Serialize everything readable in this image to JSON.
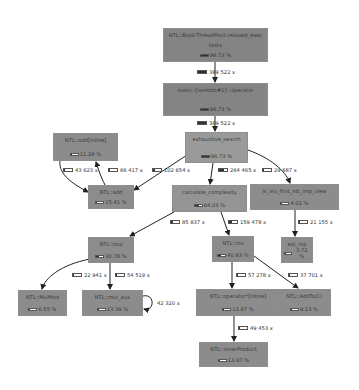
{
  "diagram": {
    "type": "call-graph",
    "nodes": [
      {
        "id": "n0",
        "name": "NTL::BasicThreadPool::relaxed_exec",
        "name2": "tasks",
        "pct": "96.73 %",
        "fill": 1.0,
        "color": "#848484",
        "x": 163,
        "y": 28,
        "w": 105,
        "h": 34
      },
      {
        "id": "n1",
        "name": "main::{lambda#1}::operator",
        "pct": "96.73 %",
        "fill": 1.0,
        "color": "#848484",
        "x": 163,
        "y": 83,
        "w": 105,
        "h": 33
      },
      {
        "id": "n2",
        "name": "exhaustive_search",
        "pct": "96.73 %",
        "fill": 1.0,
        "color": "#9a9a9a",
        "x": 185,
        "y": 132,
        "w": 63,
        "h": 31
      },
      {
        "id": "n3",
        "name": "NTL::add[inline]",
        "pct": "11.28 %",
        "fill": 0.12,
        "color": "#8c8c8c",
        "x": 53,
        "y": 133,
        "w": 65,
        "h": 28
      },
      {
        "id": "n4",
        "name": "NTL::add",
        "pct": "15.41 %",
        "fill": 0.16,
        "color": "#8c8c8c",
        "x": 88,
        "y": 185,
        "w": 46,
        "h": 24
      },
      {
        "id": "n5",
        "name": "calculate_complexity",
        "pct": "64.03 %",
        "fill": 0.66,
        "color": "#949494",
        "x": 172,
        "y": 185,
        "w": 75,
        "h": 27
      },
      {
        "id": "n6",
        "name": "is_inv_first_ntt_imp_view",
        "pct": "4.02 %",
        "fill": 0.05,
        "color": "#8c8c8c",
        "x": 250,
        "y": 184,
        "w": 89,
        "h": 26
      },
      {
        "id": "n7",
        "name": "NTL::mul",
        "pct": "30.78 %",
        "fill": 0.32,
        "color": "#8c8c8c",
        "x": 88,
        "y": 237,
        "w": 46,
        "h": 26
      },
      {
        "id": "n8",
        "name": "NTL::inv",
        "pct": "40.63 %",
        "fill": 0.42,
        "color": "#8c8c8c",
        "x": 212,
        "y": 236,
        "w": 42,
        "h": 26
      },
      {
        "id": "n9",
        "name": "ext_mp",
        "pct": "3.72 %",
        "fill": 0.04,
        "color": "#8c8c8c",
        "x": 281,
        "y": 237,
        "w": 32,
        "h": 26
      },
      {
        "id": "n10",
        "name": "NTL::MulMod",
        "pct": "6.55 %",
        "fill": 0.07,
        "color": "#8c8c8c",
        "x": 18,
        "y": 290,
        "w": 49,
        "h": 26
      },
      {
        "id": "n11",
        "name": "NTL::mul_aux",
        "pct": "13.39 %",
        "fill": 0.14,
        "color": "#8c8c8c",
        "x": 82,
        "y": 290,
        "w": 61,
        "h": 26
      },
      {
        "id": "n12",
        "name": "NTL::operator*[inline]",
        "pct": "13.87 %",
        "fill": 0.14,
        "color": "#8c8c8c",
        "x": 196,
        "y": 289,
        "w": 84,
        "h": 27
      },
      {
        "id": "n13",
        "name": "NTL::AddTo/Ci",
        "pct": "9.13 %",
        "fill": 0.09,
        "color": "#8c8c8c",
        "x": 277,
        "y": 289,
        "w": 54,
        "h": 27
      },
      {
        "id": "n14",
        "name": "NTL::innerProduct",
        "pct": "13.97 %",
        "fill": 0.14,
        "color": "#8c8c8c",
        "x": 199,
        "y": 342,
        "w": 69,
        "h": 25
      }
    ],
    "edges": [
      {
        "from": "n0",
        "to": "n1",
        "count": "389 522 x",
        "fill": 1.0,
        "lx": 197,
        "ly": 72
      },
      {
        "from": "n1",
        "to": "n2",
        "count": "389 522 x",
        "fill": 1.0,
        "lx": 197,
        "ly": 123
      },
      {
        "from": "n2",
        "to": "n4",
        "count": "102 654 x",
        "fill": 0.26,
        "lx": 160,
        "ly": 170
      },
      {
        "from": "n2",
        "to": "n5",
        "count": "264 465 x",
        "fill": 0.68,
        "lx": 211,
        "ly": 170
      },
      {
        "from": "n2",
        "to": "n6",
        "count": "29 687 x",
        "fill": 0.08,
        "lx": 269,
        "ly": 170
      },
      {
        "from": "n3",
        "to": "n4",
        "count": "43 623 x",
        "fill": 0.11,
        "lx": 64,
        "ly": 170
      },
      {
        "from": "n4",
        "to": "n3",
        "count": "66 417 x",
        "fill": 0.17,
        "lx": 108,
        "ly": 170
      },
      {
        "from": "n5",
        "to": "n7",
        "count": "85 837 x",
        "fill": 0.22,
        "lx": 160,
        "ly": 222
      },
      {
        "from": "n5",
        "to": "n8",
        "count": "159 478 x",
        "fill": 0.41,
        "lx": 228,
        "ly": 222
      },
      {
        "from": "n6",
        "to": "n9",
        "count": "21 155 x",
        "fill": 0.05,
        "lx": 297,
        "ly": 222
      },
      {
        "from": "n7",
        "to": "n10",
        "count": "22 941 x",
        "fill": 0.06,
        "lx": 72,
        "ly": 275
      },
      {
        "from": "n7",
        "to": "n11",
        "count": "54 519 x",
        "fill": 0.14,
        "lx": 115,
        "ly": 275
      },
      {
        "from": "n11",
        "to": "n11",
        "count": "42 320 x",
        "fill": 0.11,
        "lx": 157,
        "ly": 303
      },
      {
        "from": "n8",
        "to": "n12",
        "count": "57 278 x",
        "fill": 0.15,
        "lx": 235,
        "ly": 275
      },
      {
        "from": "n8",
        "to": "n13",
        "count": "37 701 x",
        "fill": 0.1,
        "lx": 288,
        "ly": 275
      },
      {
        "from": "n12",
        "to": "n14",
        "count": "49 453 x",
        "fill": 0.13,
        "lx": 239,
        "ly": 328
      }
    ]
  }
}
